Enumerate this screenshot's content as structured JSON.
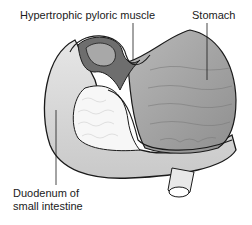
{
  "diagram": {
    "labels": {
      "pyloric_muscle": "Hypertrophic pyloric muscle",
      "stomach": "Stomach",
      "duodenum_line1": "Duodenum of",
      "duodenum_line2": "small intestine"
    },
    "colors": {
      "duodenum": "#d9d9d9",
      "duodenum_inner": "#f4f4f4",
      "stomach": "#9c9c9c",
      "pyloric_muscle": "#6e6e6e",
      "outline": "#1a1a1a"
    }
  }
}
